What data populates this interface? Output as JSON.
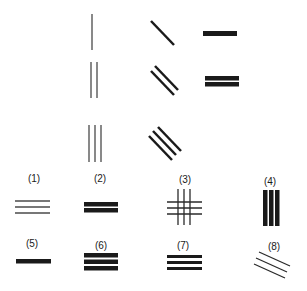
{
  "colors": {
    "ink": "#1a1a1a",
    "thin_ink": "#4a4a4a",
    "background": "#ffffff"
  },
  "top_figures": {
    "column_vertical": [
      "single-thin-vertical",
      "double-thin-vertical",
      "triple-thin-vertical"
    ],
    "column_diagonal": [
      "single-diagonal",
      "double-diagonal",
      "triple-diagonal"
    ],
    "column_horizontal": [
      "single-thick-horizontal",
      "double-thick-horizontal"
    ]
  },
  "options": [
    {
      "label": "(1)",
      "description": "three thin horizontal lines"
    },
    {
      "label": "(2)",
      "description": "two thick horizontal bars"
    },
    {
      "label": "(3)",
      "description": "grid of three vertical and three horizontal thin lines"
    },
    {
      "label": "(4)",
      "description": "three thick vertical bars"
    },
    {
      "label": "(5)",
      "description": "one thick horizontal bar"
    },
    {
      "label": "(6)",
      "description": "three thick horizontal bars"
    },
    {
      "label": "(7)",
      "description": "three medium horizontal bars"
    },
    {
      "label": "(8)",
      "description": "three thin diagonal lines"
    }
  ]
}
